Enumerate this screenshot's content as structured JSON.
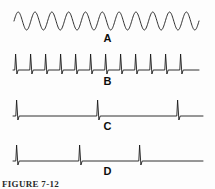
{
  "figure": {
    "caption": "FIGURE 7-12",
    "background_color": "#fdfdfd",
    "stroke_color": "#1a1a1a",
    "width": 215,
    "height": 189
  },
  "traces": [
    {
      "id": "A",
      "label": "A",
      "kind": "sine",
      "description": "Continuous sinusoidal wave, high frequency",
      "cycles": 11,
      "amplitude": 9,
      "x_start": 14,
      "x_end": 199,
      "baseline_y": 13
    },
    {
      "id": "B",
      "label": "B",
      "kind": "spike-train",
      "description": "High-frequency spike train, evenly spaced",
      "spike_count": 12,
      "spike_positions": [
        16,
        31,
        46,
        61,
        76,
        91,
        106,
        121,
        136,
        151,
        166,
        181
      ],
      "x_start": 13,
      "x_end": 199,
      "baseline_y": 20,
      "spike_height": 16,
      "undershoot": 4
    },
    {
      "id": "C",
      "label": "C",
      "kind": "spike-train",
      "description": "Low-frequency spike train, wide even spacing",
      "spike_count": 3,
      "spike_positions": [
        17,
        98,
        178
      ],
      "x_start": 13,
      "x_end": 203,
      "baseline_y": 18,
      "spike_height": 16,
      "undershoot": 4
    },
    {
      "id": "D",
      "label": "D",
      "kind": "spike-train",
      "description": "Low-frequency spike train, burst then long pause",
      "spike_count": 3,
      "spike_positions": [
        17,
        80,
        140
      ],
      "x_start": 13,
      "x_end": 203,
      "baseline_y": 18,
      "spike_height": 16,
      "undershoot": 4
    }
  ],
  "chart_data": {
    "type": "line",
    "title": "FIGURE 7-12",
    "xlabel": "",
    "ylabel": "",
    "grid": false,
    "legend": "none",
    "series": [
      {
        "name": "A",
        "waveform": "sine",
        "cycles": 11,
        "amplitude": 9,
        "relative_frequency": 11
      },
      {
        "name": "B",
        "waveform": "spikes",
        "spike_x": [
          16,
          31,
          46,
          61,
          76,
          91,
          106,
          121,
          136,
          151,
          166,
          181
        ],
        "relative_frequency": 12
      },
      {
        "name": "C",
        "waveform": "spikes",
        "spike_x": [
          17,
          98,
          178
        ],
        "relative_frequency": 3
      },
      {
        "name": "D",
        "waveform": "spikes",
        "spike_x": [
          17,
          80,
          140
        ],
        "relative_frequency": 3
      }
    ]
  }
}
